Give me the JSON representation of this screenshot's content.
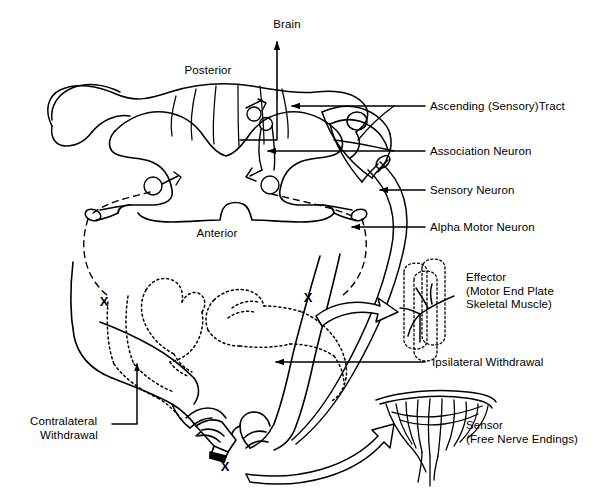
{
  "figure": {
    "ink_color": "#000000",
    "background": "#ffffff"
  },
  "anatomy_labels": {
    "brain": "Brain",
    "posterior": "Posterior",
    "anterior": "Anterior"
  },
  "callouts": [
    {
      "id": "ascending-tract",
      "text": "Ascending (Sensory)Tract",
      "x": 430,
      "y": 106
    },
    {
      "id": "association-neuron",
      "text": "Association Neuron",
      "x": 430,
      "y": 151
    },
    {
      "id": "sensory-neuron",
      "text": "Sensory Neuron",
      "x": 430,
      "y": 190
    },
    {
      "id": "alpha-motor-neuron",
      "text": "Alpha Motor Neuron",
      "x": 430,
      "y": 227
    },
    {
      "id": "ipsilateral-withdrawal",
      "text": "Ipsilateral Withdrawal",
      "x": 432,
      "y": 362
    }
  ],
  "effector": {
    "line1": "Effector",
    "line2": "(Motor End Plate",
    "line3": "Skeletal Muscle)",
    "x": 466,
    "y": 277
  },
  "sensor": {
    "line1": "Sensor",
    "line2": "(Free Nerve Endings)",
    "x": 466,
    "y": 426
  },
  "contralateral": {
    "line1": "Contralateral",
    "line2": "Withdrawal",
    "x": 30,
    "y": 421
  },
  "x_marks": [
    {
      "id": "x-left-arm",
      "label": "X",
      "x": 104,
      "y": 301
    },
    {
      "id": "x-right-arm",
      "label": "X",
      "x": 308,
      "y": 297
    },
    {
      "id": "x-stimulus",
      "label": "X",
      "x": 225,
      "y": 464
    }
  ]
}
